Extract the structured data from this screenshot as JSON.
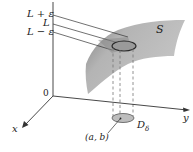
{
  "figure": {
    "type": "3d-limit-diagram",
    "labels": {
      "l_plus_eps": "L + ε",
      "l": "L",
      "l_minus_eps": "L − ε",
      "surface": "S",
      "origin": "0",
      "x_axis": "x",
      "y_axis": "y",
      "point": "(a, b)",
      "disk": "D",
      "disk_sub": "δ"
    },
    "colors": {
      "surface_fill": "#b9b9b9",
      "surface_shadow": "#8f8f8f",
      "ellipse_fill": "#9a9a9a",
      "ellipse_stroke": "#2c2c2c",
      "axis": "#333333",
      "dashed": "#777777",
      "disk_fill": "#bdbdbd"
    }
  }
}
